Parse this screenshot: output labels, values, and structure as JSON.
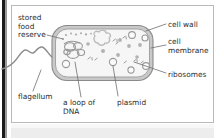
{
  "figure": {
    "type": "labelled-biology-diagram",
    "background_color": "#ffffff",
    "line_color": "#6e6e6e",
    "text_color": "#2b2b2b",
    "cell_wall_color": "#bdbdbd",
    "cytoplasm_color": "#f2f2f2",
    "organelle_color": "#b0b0b0"
  },
  "labels": {
    "stored_food_reserve": "stored\nfood\nreserve",
    "flagellum": "flagellum",
    "loop_of_dna": "a loop of\nDNA",
    "plasmid": "plasmid",
    "cell_wall": "cell wall",
    "cell_membrane": "cell\nmembrane",
    "ribosomes": "ribosomes"
  },
  "parts": [
    {
      "name": "cell wall",
      "side": "right"
    },
    {
      "name": "cell membrane",
      "side": "right"
    },
    {
      "name": "ribosomes",
      "side": "right"
    },
    {
      "name": "stored food reserve",
      "side": "left"
    },
    {
      "name": "flagellum",
      "side": "left"
    },
    {
      "name": "a loop of DNA",
      "side": "bottom"
    },
    {
      "name": "plasmid",
      "side": "bottom"
    }
  ]
}
